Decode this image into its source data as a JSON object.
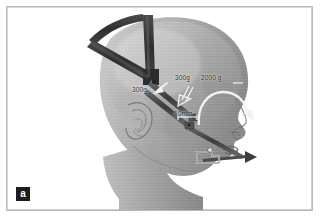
{
  "figure": {
    "panel_letter": "a",
    "caption_labels": [
      {
        "id": "force-left",
        "text": "300g",
        "x": 131,
        "y": 84
      },
      {
        "id": "force-mid",
        "text": "300g",
        "x": 174,
        "y": 72
      },
      {
        "id": "force-right",
        "text": "2000 g",
        "x": 200,
        "y": 72
      },
      {
        "id": "distance",
        "text": "10mm",
        "x": 173,
        "y": 108
      }
    ],
    "colors": {
      "frame_border": "#b9b9b9",
      "background": "#ffffff",
      "skin_light": "#d5d5d5",
      "skin_mid": "#a9a9a9",
      "skin_dark": "#7d7d7d",
      "skull_shadow": "#8e8e8e",
      "strap_dark": "#3a3a3a",
      "strap_mid": "#4f4f4f",
      "appliance_light": "#e8e8e8",
      "appliance_dark": "#5a5a5a",
      "arrow_white": "#f2f2f2",
      "panel_box": "#1d1d1d",
      "panel_text": "#ffffff",
      "label_text": "#2b2b2b"
    },
    "elements": {
      "head": "lateral-profile-head",
      "headgear": "y-shaped-head-strap",
      "appliance": "intraoral-extraoral-traction-device",
      "arrows": "force-direction-arrows",
      "ear": "external-ear",
      "nose": "nose-profile",
      "lips": "lips-profile",
      "neck": "neck"
    }
  }
}
